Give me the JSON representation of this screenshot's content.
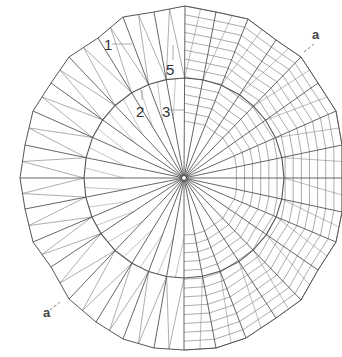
{
  "diagram": {
    "type": "radial-polygon-plan",
    "center": [
      184,
      178
    ],
    "outer_vertices": [
      [
        185,
        6
      ],
      [
        216,
        12
      ],
      [
        248,
        19
      ],
      [
        276,
        40
      ],
      [
        301,
        57
      ],
      [
        318,
        83
      ],
      [
        336,
        111
      ],
      [
        342,
        145
      ],
      [
        342,
        178
      ],
      [
        342,
        212
      ],
      [
        336,
        242
      ],
      [
        318,
        270
      ],
      [
        301,
        300
      ],
      [
        276,
        318
      ],
      [
        246,
        338
      ],
      [
        216,
        348
      ],
      [
        184,
        350
      ],
      [
        154,
        348
      ],
      [
        123,
        339
      ],
      [
        96,
        322
      ],
      [
        69,
        299
      ],
      [
        51,
        267
      ],
      [
        33,
        242
      ],
      [
        25,
        209
      ],
      [
        20,
        178
      ],
      [
        25,
        145
      ],
      [
        33,
        111
      ],
      [
        51,
        83
      ],
      [
        69,
        57
      ],
      [
        98,
        38
      ],
      [
        123,
        17
      ],
      [
        154,
        12
      ]
    ],
    "inner_vertices": [
      [
        184,
        77
      ],
      [
        150,
        82
      ],
      [
        117,
        104
      ],
      [
        96,
        136
      ],
      [
        90,
        160
      ],
      [
        88,
        178
      ],
      [
        93,
        215
      ],
      [
        115,
        248
      ],
      [
        146,
        271
      ],
      [
        184,
        279
      ],
      [
        220,
        277
      ],
      [
        252,
        262
      ],
      [
        262,
        252
      ]
    ],
    "stroke_color": "#555555",
    "hatch_color": "#666666",
    "background": "#ffffff"
  },
  "labels": {
    "l1": "1",
    "l2": "2",
    "l3": "3",
    "l5": "5",
    "a_top": "a",
    "a_bottom": "a"
  }
}
